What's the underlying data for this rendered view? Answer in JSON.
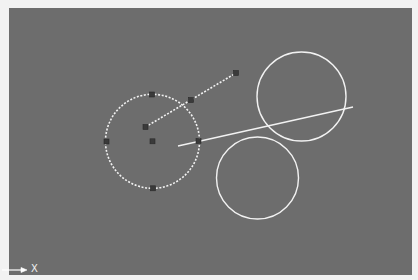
{
  "viewport": {
    "background_color": "#6d6d6d",
    "entity_color": "#f2f2f2",
    "grip_color": "#3a3a3a"
  },
  "entities": {
    "selected_circle": {
      "center": [
        152.5,
        141.3
      ],
      "radius": 47,
      "style": "dashed",
      "grips": [
        {
          "name": "center",
          "pos": [
            152.5,
            141.3
          ]
        },
        {
          "name": "quadrant-top",
          "pos": [
            152,
            94.5
          ]
        },
        {
          "name": "quadrant-right",
          "pos": [
            198.5,
            141
          ]
        },
        {
          "name": "quadrant-bottom",
          "pos": [
            153,
            188.3
          ]
        },
        {
          "name": "quadrant-left",
          "pos": [
            106.5,
            141.5
          ]
        }
      ]
    },
    "selected_line": {
      "start": [
        145.5,
        127
      ],
      "end": [
        236,
        73
      ],
      "style": "dashed",
      "grips": [
        {
          "name": "start",
          "pos": [
            145.5,
            127
          ]
        },
        {
          "name": "midpoint",
          "pos": [
            191,
            100
          ]
        },
        {
          "name": "end",
          "pos": [
            236,
            73
          ]
        }
      ]
    },
    "circle_upper_right": {
      "center": [
        301.5,
        96.5
      ],
      "radius": 44.5
    },
    "circle_lower": {
      "center": [
        257.5,
        178
      ],
      "radius": 41
    },
    "line_solid": {
      "start": [
        178,
        146
      ],
      "end": [
        353,
        107
      ]
    }
  },
  "ucs_icon": {
    "axis_label": "X"
  }
}
